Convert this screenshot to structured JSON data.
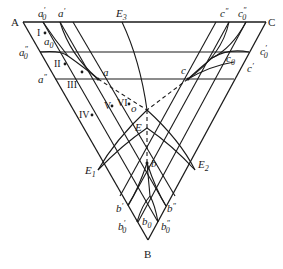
{
  "diagram": {
    "type": "ternary-phase-diagram",
    "vertices": {
      "A": {
        "label": "A",
        "x": 23,
        "y": 22
      },
      "C": {
        "label": "C",
        "x": 266,
        "y": 22
      },
      "B": {
        "label": "B",
        "x": 148,
        "y": 240
      }
    },
    "eutectic_lines": {
      "E1": "E",
      "E2": "E",
      "E3": "E",
      "E1_sub": "1",
      "E2_sub": "2",
      "E3_sub": "3"
    },
    "points": {
      "a": "a",
      "c": "c",
      "b": "b",
      "o": "o",
      "E": "E"
    },
    "labels": {
      "a0_prime": {
        "base": "a",
        "sub": "0",
        "sup": "′"
      },
      "a_prime": {
        "base": "a",
        "sup": "′"
      },
      "a0": {
        "base": "a",
        "sub": "0"
      },
      "a0_double": {
        "base": "a",
        "sub": "0",
        "sup": "″"
      },
      "a_double": {
        "base": "a",
        "sup": "″"
      },
      "c_double": {
        "base": "c",
        "sup": "″"
      },
      "c0_double": {
        "base": "c",
        "sub": "0",
        "sup": "″"
      },
      "c0_prime": {
        "base": "c",
        "sub": "0",
        "sup": "′"
      },
      "c0": {
        "base": "c",
        "sub": "0"
      },
      "c_prime": {
        "base": "c",
        "sup": "′"
      },
      "b_prime": {
        "base": "b",
        "sup": "′"
      },
      "b0_prime": {
        "base": "b",
        "sub": "0",
        "sup": "′"
      },
      "b0": {
        "base": "b",
        "sub": "0"
      },
      "b_double": {
        "base": "b",
        "sup": "″"
      },
      "b0_double": {
        "base": "b",
        "sub": "0",
        "sup": "″"
      }
    },
    "regions": [
      "I",
      "II",
      "III",
      "IV",
      "V",
      "VI"
    ],
    "region_labels": {
      "I": "I",
      "II": "II",
      "III": "III",
      "IV": "IV",
      "V": "V",
      "VI": "VI"
    },
    "prime": "′",
    "double_prime": "″",
    "sub0": "0"
  }
}
